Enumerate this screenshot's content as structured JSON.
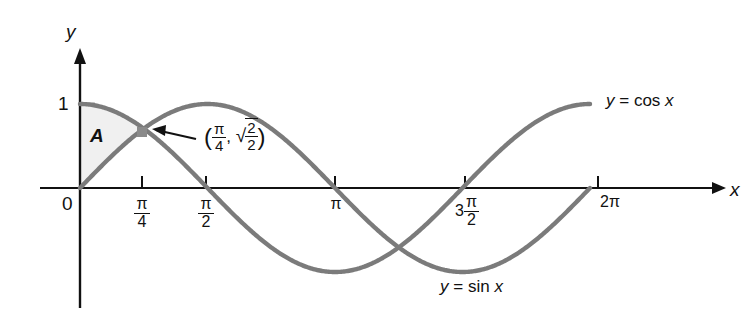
{
  "chart_data": {
    "type": "line",
    "title": "",
    "xlabel": "x",
    "ylabel": "y",
    "xlim": [
      0,
      6.283185307179586
    ],
    "ylim": [
      -1.15,
      1.25
    ],
    "grid": false,
    "legend_position": "inline-curve-labels",
    "x_ticks": [
      {
        "value": 0,
        "label": "0"
      },
      {
        "value": 0.7853981634,
        "label": "π/4",
        "numerator": "π",
        "denominator": "4"
      },
      {
        "value": 1.5707963268,
        "label": "π/2",
        "numerator": "π",
        "denominator": "2"
      },
      {
        "value": 3.1415926536,
        "label": "π"
      },
      {
        "value": 4.7123889804,
        "label": "3π/2",
        "lead": "3",
        "numerator": "π",
        "denominator": "2"
      },
      {
        "value": 6.2831853072,
        "label": "2π"
      }
    ],
    "y_ticks": [
      {
        "value": 1,
        "label": "1"
      }
    ],
    "series": [
      {
        "name": "y = cos x",
        "function": "cos",
        "label_html": "y = cos x",
        "color": "#7b7b7b",
        "linewidth": 4,
        "x_start": 0,
        "x_end": 6.2831853072
      },
      {
        "name": "y = sin x",
        "function": "sin",
        "label_html": "y = sin x",
        "color": "#7b7b7b",
        "linewidth": 4,
        "x_start": 0,
        "x_end": 6.2831853072
      }
    ],
    "shaded_regions": [
      {
        "name": "A",
        "label": "A",
        "x_from": 0,
        "x_to": 0.7853981634,
        "upper": "cos",
        "lower": "sin",
        "fill": "#f0f0f0"
      }
    ],
    "annotations": [
      {
        "name": "intersection-point",
        "x": 0.7853981634,
        "y": 0.7071067812,
        "marker": "square-dot",
        "label_parts": {
          "open_paren": "(",
          "x_numerator": "π",
          "x_denominator": "4",
          "comma": ",",
          "radical": "√",
          "y_numerator": "2",
          "y_denominator": "2",
          "close_paren": ")"
        },
        "label_text": "(π/4, √2/2)",
        "arrow": "left-pointing"
      }
    ]
  },
  "axes": {
    "y_axis_name": "y",
    "x_axis_name": "x",
    "origin_label": "0",
    "one_label": "1"
  },
  "labels": {
    "cos_curve": {
      "lhs": "y",
      "eq": "=",
      "rhs": "cos",
      "arg": "x"
    },
    "sin_curve": {
      "lhs": "y",
      "eq": "=",
      "rhs": "sin",
      "arg": "x"
    },
    "region_a": "A"
  },
  "colors": {
    "curve": "#7b7b7b",
    "axis": "#111111",
    "text": "#111111",
    "shade": "#f0f0f0",
    "background": "#ffffff"
  }
}
